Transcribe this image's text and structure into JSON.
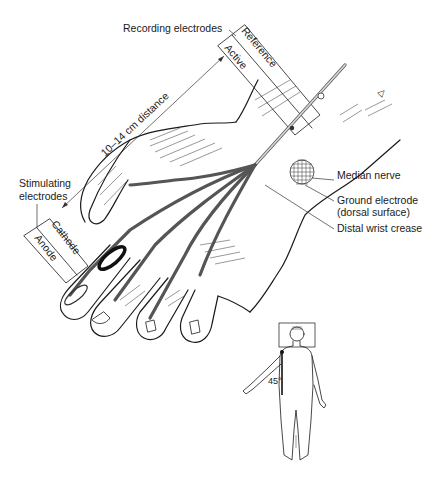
{
  "figure": {
    "labels": {
      "recording_electrodes": "Recording electrodes",
      "reference": "Reference",
      "active": "Active",
      "distance": "10–14 cm distance",
      "stimulating_line1": "Stimulating",
      "stimulating_line2": "electrodes",
      "cathode": "Cathode",
      "anode": "Anode",
      "median_nerve": "Median nerve",
      "ground_line1": "Ground electrode",
      "ground_line2": "(dorsal surface)",
      "distal_wrist_crease": "Distal wrist crease",
      "angle": "45°"
    },
    "colors": {
      "ink": "#1a1a1a",
      "nerve_fill": "#d6d6d6",
      "background": "#ffffff"
    }
  }
}
